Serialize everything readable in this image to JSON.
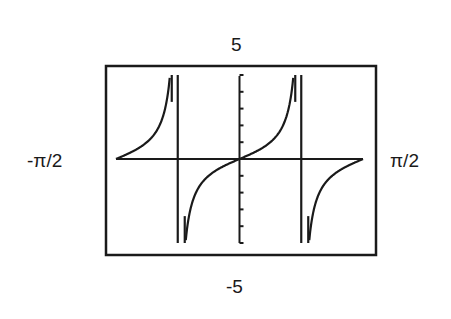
{
  "chart_data": {
    "type": "line",
    "title": "",
    "function": "tan(2x)",
    "series": [
      {
        "name": "tan(2x)",
        "branches": [
          {
            "x_range": [
              "-π/2",
              "-π/4"
            ],
            "note": "rising from 0 to +∞"
          },
          {
            "x_range": [
              "-π/4",
              "π/4"
            ],
            "note": "rising from -∞ through 0 to +∞"
          },
          {
            "x_range": [
              "π/4",
              "π/2"
            ],
            "note": "rising from -∞ to 0"
          }
        ],
        "asymptotes_x": [
          "-π/4",
          "π/4"
        ]
      }
    ],
    "xlim": [
      "-π/2",
      "π/2"
    ],
    "ylim": [
      -5,
      5
    ],
    "xlabel": "",
    "ylabel": "",
    "y_ticks": [
      -5,
      -4,
      -3,
      -2,
      -1,
      0,
      1,
      2,
      3,
      4,
      5
    ],
    "grid": false,
    "legend": null
  },
  "labels": {
    "ymax": "5",
    "ymin": "-5",
    "xmin": "-π/2",
    "xmax": "π/2"
  },
  "colors": {
    "curve": "#1a1a1a",
    "frame": "#1a1a1a",
    "background": "#ffffff"
  }
}
